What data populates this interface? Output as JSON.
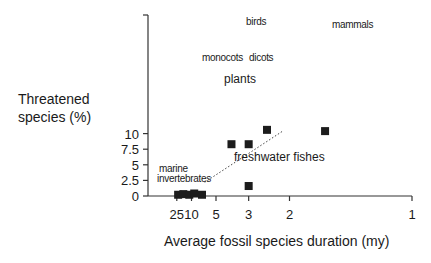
{
  "chart_data": {
    "type": "scatter",
    "title": "",
    "xlabel": "Average fossil species duration (my)",
    "ylabel": [
      "Threatened",
      "species (%)"
    ],
    "x_scale": "reciprocal (1/duration)",
    "x_ticks": [
      25,
      10,
      5,
      3,
      2,
      1
    ],
    "x_tick_labels": [
      "25",
      "10",
      "5",
      "3",
      "2",
      "1"
    ],
    "y_ticks": [
      0,
      2.5,
      5,
      7.5,
      10
    ],
    "y_tick_labels": [
      "0",
      "2.5",
      "5",
      "7.5",
      "10"
    ],
    "ylim": [
      0,
      11.5
    ],
    "grid": false,
    "points": [
      {
        "name": "birds",
        "duration": 2.45,
        "threatened": 10.6
      },
      {
        "name": "mammals",
        "duration": 1.55,
        "threatened": 10.4
      },
      {
        "name": "monocots",
        "duration": 3.8,
        "threatened": 8.3
      },
      {
        "name": "dicots",
        "duration": 3.0,
        "threatened": 8.3
      },
      {
        "name": "freshwater fishes",
        "duration": 3.0,
        "threatened": 1.6
      },
      {
        "name": "marine invertebrates 1",
        "duration": 22,
        "threatened": 0.2
      },
      {
        "name": "marine invertebrates 2",
        "duration": 15,
        "threatened": 0.3
      },
      {
        "name": "marine invertebrates 3",
        "duration": 11,
        "threatened": 0.2
      },
      {
        "name": "marine invertebrates 4",
        "duration": 9,
        "threatened": 0.4
      },
      {
        "name": "marine invertebrates 5",
        "duration": 7,
        "threatened": 0.2
      }
    ],
    "annotations": [
      {
        "text": "birds",
        "target": "birds"
      },
      {
        "text": "mammals",
        "target": "mammals"
      },
      {
        "text": "monocots",
        "target": "monocots"
      },
      {
        "text": "dicots",
        "target": "dicots"
      },
      {
        "text": "plants",
        "target": "plants group"
      },
      {
        "text": "freshwater fishes",
        "target": "freshwater fishes"
      },
      {
        "text": "marine",
        "target": "marine invertebrates"
      },
      {
        "text": "invertebrates",
        "target": "marine invertebrates"
      }
    ],
    "trend_line": {
      "style": "dotted",
      "from": {
        "duration": 6.5,
        "threatened": 2.2
      },
      "to": {
        "duration": 2.1,
        "threatened": 10.5
      }
    }
  }
}
